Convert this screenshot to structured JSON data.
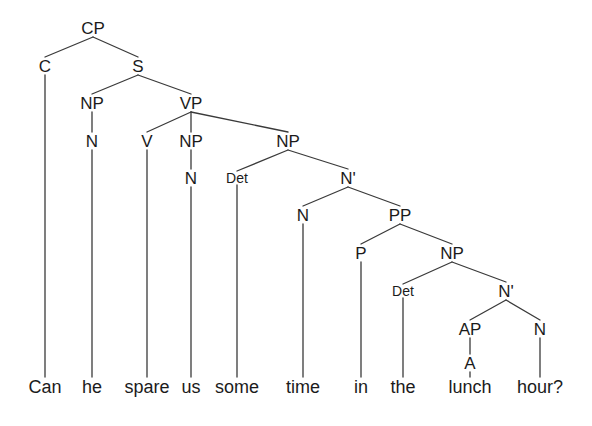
{
  "figure": {
    "kind": "syntax-tree",
    "sentence": "Can he spare us some time in the lunch hour?",
    "background_color": "#ffffff",
    "line_color": "#3a3a3a",
    "text_color": "#1b1b1b"
  },
  "nodes": [
    {
      "id": "cp",
      "label": "CP",
      "x": 93,
      "y": 28,
      "size": "normal"
    },
    {
      "id": "c",
      "label": "C",
      "x": 45,
      "y": 66,
      "size": "normal"
    },
    {
      "id": "s",
      "label": "S",
      "x": 138,
      "y": 66,
      "size": "normal"
    },
    {
      "id": "np1",
      "label": "NP",
      "x": 92,
      "y": 103,
      "size": "normal"
    },
    {
      "id": "vp",
      "label": "VP",
      "x": 191,
      "y": 103,
      "size": "normal"
    },
    {
      "id": "n1",
      "label": "N",
      "x": 92,
      "y": 141,
      "size": "normal"
    },
    {
      "id": "v",
      "label": "V",
      "x": 147,
      "y": 141,
      "size": "normal"
    },
    {
      "id": "np2",
      "label": "NP",
      "x": 191,
      "y": 141,
      "size": "normal"
    },
    {
      "id": "np3",
      "label": "NP",
      "x": 288,
      "y": 141,
      "size": "normal"
    },
    {
      "id": "n2",
      "label": "N",
      "x": 191,
      "y": 178,
      "size": "normal"
    },
    {
      "id": "det1",
      "label": "Det",
      "x": 237,
      "y": 178,
      "size": "small"
    },
    {
      "id": "nbar1",
      "label": "N'",
      "x": 348,
      "y": 178,
      "size": "normal"
    },
    {
      "id": "n3",
      "label": "N",
      "x": 303,
      "y": 215,
      "size": "normal"
    },
    {
      "id": "pp",
      "label": "PP",
      "x": 400,
      "y": 215,
      "size": "normal"
    },
    {
      "id": "p",
      "label": "P",
      "x": 361,
      "y": 253,
      "size": "normal"
    },
    {
      "id": "np4",
      "label": "NP",
      "x": 452,
      "y": 253,
      "size": "normal"
    },
    {
      "id": "det2",
      "label": "Det",
      "x": 403,
      "y": 291,
      "size": "small"
    },
    {
      "id": "nbar2",
      "label": "N'",
      "x": 506,
      "y": 291,
      "size": "normal"
    },
    {
      "id": "ap",
      "label": "AP",
      "x": 470,
      "y": 329,
      "size": "normal"
    },
    {
      "id": "n4",
      "label": "N",
      "x": 540,
      "y": 329,
      "size": "normal"
    },
    {
      "id": "a",
      "label": "A",
      "x": 470,
      "y": 363,
      "size": "normal"
    }
  ],
  "leaves": [
    {
      "id": "w1",
      "label": "Can",
      "x": 45,
      "y": 387,
      "parent": "c"
    },
    {
      "id": "w2",
      "label": "he",
      "x": 92,
      "y": 387,
      "parent": "n1"
    },
    {
      "id": "w3",
      "label": "spare",
      "x": 147,
      "y": 387,
      "parent": "v"
    },
    {
      "id": "w4",
      "label": "us",
      "x": 191,
      "y": 387,
      "parent": "n2"
    },
    {
      "id": "w5",
      "label": "some",
      "x": 237,
      "y": 387,
      "parent": "det1"
    },
    {
      "id": "w6",
      "label": "time",
      "x": 303,
      "y": 387,
      "parent": "n3"
    },
    {
      "id": "w7",
      "label": "in",
      "x": 361,
      "y": 387,
      "parent": "p"
    },
    {
      "id": "w8",
      "label": "the",
      "x": 403,
      "y": 387,
      "parent": "det2"
    },
    {
      "id": "w9",
      "label": "lunch",
      "x": 470,
      "y": 387,
      "parent": "a"
    },
    {
      "id": "w10",
      "label": "hour?",
      "x": 540,
      "y": 387,
      "parent": "n4"
    }
  ],
  "edges": [
    {
      "from": "cp",
      "to": "c"
    },
    {
      "from": "cp",
      "to": "s"
    },
    {
      "from": "s",
      "to": "np1"
    },
    {
      "from": "s",
      "to": "vp"
    },
    {
      "from": "np1",
      "to": "n1"
    },
    {
      "from": "vp",
      "to": "v"
    },
    {
      "from": "vp",
      "to": "np2"
    },
    {
      "from": "vp",
      "to": "np3"
    },
    {
      "from": "np2",
      "to": "n2"
    },
    {
      "from": "np3",
      "to": "det1"
    },
    {
      "from": "np3",
      "to": "nbar1"
    },
    {
      "from": "nbar1",
      "to": "n3"
    },
    {
      "from": "nbar1",
      "to": "pp"
    },
    {
      "from": "pp",
      "to": "p"
    },
    {
      "from": "pp",
      "to": "np4"
    },
    {
      "from": "np4",
      "to": "det2"
    },
    {
      "from": "np4",
      "to": "nbar2"
    },
    {
      "from": "nbar2",
      "to": "ap"
    },
    {
      "from": "nbar2",
      "to": "n4"
    },
    {
      "from": "ap",
      "to": "a"
    },
    {
      "from": "c",
      "to": "w1"
    },
    {
      "from": "n1",
      "to": "w2"
    },
    {
      "from": "v",
      "to": "w3"
    },
    {
      "from": "n2",
      "to": "w4"
    },
    {
      "from": "det1",
      "to": "w5"
    },
    {
      "from": "n3",
      "to": "w6"
    },
    {
      "from": "p",
      "to": "w7"
    },
    {
      "from": "det2",
      "to": "w8"
    },
    {
      "from": "a",
      "to": "w9"
    },
    {
      "from": "n4",
      "to": "w10"
    }
  ]
}
